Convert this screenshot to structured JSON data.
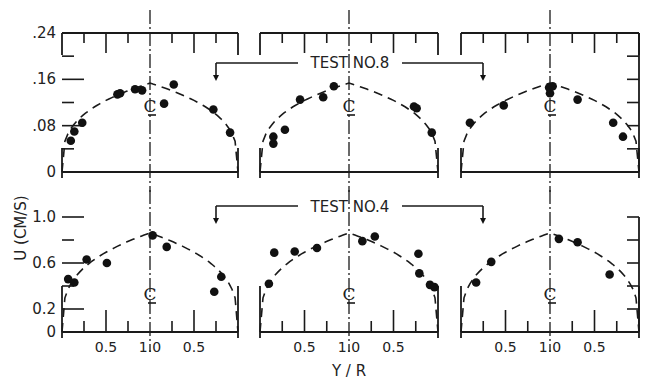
{
  "chart_data": {
    "type": "scatter",
    "xlabel": "Y / R",
    "ylabel": "U (CM/S)",
    "centerline_label": "CL",
    "x_tick_labels": [
      "0.5",
      "1.0",
      "0.5"
    ],
    "x_range_description": "wall (Y/R=0) to centerline (Y/R=1.0) to wall (Y/R=0)",
    "rows": [
      {
        "name": "TEST NO.8",
        "ylim": [
          0,
          0.24
        ],
        "y_ticks": [
          0,
          0.08,
          0.16,
          0.24
        ],
        "y_tick_labels": [
          "0",
          ".08",
          ".16",
          ".24"
        ],
        "curve_peak": 0.155,
        "panels": [
          {
            "points": [
              {
                "side": "left",
                "yr": 0.1,
                "u": 0.054
              },
              {
                "side": "left",
                "yr": 0.14,
                "u": 0.07
              },
              {
                "side": "left",
                "yr": 0.23,
                "u": 0.085
              },
              {
                "side": "left",
                "yr": 0.63,
                "u": 0.134
              },
              {
                "side": "left",
                "yr": 0.66,
                "u": 0.136
              },
              {
                "side": "left",
                "yr": 0.83,
                "u": 0.143
              },
              {
                "side": "left",
                "yr": 0.91,
                "u": 0.141
              },
              {
                "side": "right",
                "yr": 0.84,
                "u": 0.118
              },
              {
                "side": "right",
                "yr": 0.73,
                "u": 0.151
              },
              {
                "side": "right",
                "yr": 0.28,
                "u": 0.108
              },
              {
                "side": "right",
                "yr": 0.09,
                "u": 0.068
              }
            ]
          },
          {
            "points": [
              {
                "side": "left",
                "yr": 0.15,
                "u": 0.061
              },
              {
                "side": "left",
                "yr": 0.15,
                "u": 0.049
              },
              {
                "side": "left",
                "yr": 0.28,
                "u": 0.073
              },
              {
                "side": "left",
                "yr": 0.45,
                "u": 0.125
              },
              {
                "side": "left",
                "yr": 0.71,
                "u": 0.129
              },
              {
                "side": "left",
                "yr": 0.83,
                "u": 0.148
              },
              {
                "side": "right",
                "yr": 0.27,
                "u": 0.113
              },
              {
                "side": "right",
                "yr": 0.24,
                "u": 0.11
              },
              {
                "side": "right",
                "yr": 0.07,
                "u": 0.068
              }
            ]
          },
          {
            "points": [
              {
                "side": "left",
                "yr": 0.1,
                "u": 0.085
              },
              {
                "side": "left",
                "yr": 0.48,
                "u": 0.115
              },
              {
                "side": "left",
                "yr": 1.0,
                "u": 0.136
              },
              {
                "side": "left",
                "yr": 0.99,
                "u": 0.146
              },
              {
                "side": "right",
                "yr": 0.97,
                "u": 0.148
              },
              {
                "side": "right",
                "yr": 0.69,
                "u": 0.125
              },
              {
                "side": "right",
                "yr": 0.29,
                "u": 0.085
              },
              {
                "side": "right",
                "yr": 0.18,
                "u": 0.061
              }
            ]
          }
        ]
      },
      {
        "name": "TEST NO.4",
        "ylim": [
          0,
          1.0
        ],
        "y_ticks": [
          0,
          0.2,
          0.6,
          1.0
        ],
        "y_tick_labels": [
          "0",
          "0.2",
          "0.6",
          "1.0"
        ],
        "curve_peak": 0.87,
        "panels": [
          {
            "points": [
              {
                "side": "left",
                "yr": 0.07,
                "u": 0.46
              },
              {
                "side": "left",
                "yr": 0.14,
                "u": 0.43
              },
              {
                "side": "left",
                "yr": 0.28,
                "u": 0.63
              },
              {
                "side": "left",
                "yr": 0.51,
                "u": 0.6
              },
              {
                "side": "right",
                "yr": 0.97,
                "u": 0.84
              },
              {
                "side": "right",
                "yr": 0.81,
                "u": 0.74
              },
              {
                "side": "right",
                "yr": 0.27,
                "u": 0.35
              },
              {
                "side": "right",
                "yr": 0.19,
                "u": 0.48
              }
            ]
          },
          {
            "points": [
              {
                "side": "left",
                "yr": 0.1,
                "u": 0.42
              },
              {
                "side": "left",
                "yr": 0.16,
                "u": 0.69
              },
              {
                "side": "left",
                "yr": 0.39,
                "u": 0.7
              },
              {
                "side": "left",
                "yr": 0.64,
                "u": 0.73
              },
              {
                "side": "right",
                "yr": 0.85,
                "u": 0.79
              },
              {
                "side": "right",
                "yr": 0.71,
                "u": 0.83
              },
              {
                "side": "right",
                "yr": 0.22,
                "u": 0.68
              },
              {
                "side": "right",
                "yr": 0.21,
                "u": 0.51
              },
              {
                "side": "right",
                "yr": 0.09,
                "u": 0.41
              },
              {
                "side": "right",
                "yr": 0.04,
                "u": 0.39
              }
            ]
          },
          {
            "points": [
              {
                "side": "left",
                "yr": 0.17,
                "u": 0.43
              },
              {
                "side": "left",
                "yr": 0.34,
                "u": 0.61
              },
              {
                "side": "right",
                "yr": 0.9,
                "u": 0.81
              },
              {
                "side": "right",
                "yr": 0.69,
                "u": 0.78
              },
              {
                "side": "right",
                "yr": 0.33,
                "u": 0.5
              }
            ]
          }
        ]
      }
    ]
  }
}
